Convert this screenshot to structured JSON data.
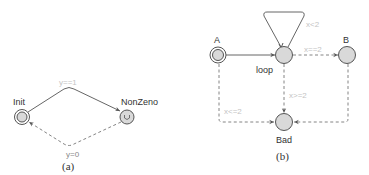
{
  "figures": [
    {
      "caption": "(a)",
      "locations": [
        {
          "id": "Init",
          "label": "Init",
          "initial": true,
          "urgent": false
        },
        {
          "id": "NonZeno",
          "label": "NonZeno",
          "initial": false,
          "urgent": true,
          "mark": "U"
        }
      ],
      "edges": [
        {
          "from": "Init",
          "to": "NonZeno",
          "style": "solid",
          "guard": "y==1"
        },
        {
          "from": "NonZeno",
          "to": "Init",
          "style": "dashed",
          "guard": "y=0"
        }
      ]
    },
    {
      "caption": "(b)",
      "locations": [
        {
          "id": "A",
          "label": "A",
          "initial": true
        },
        {
          "id": "loop",
          "label": "loop",
          "initial": false
        },
        {
          "id": "B",
          "label": "B",
          "initial": false
        },
        {
          "id": "Bad",
          "label": "Bad",
          "initial": false
        }
      ],
      "edges": [
        {
          "from": "A",
          "to": "loop",
          "style": "solid",
          "guard": ""
        },
        {
          "from": "loop",
          "to": "loop",
          "style": "solid",
          "guard": "x<2"
        },
        {
          "from": "loop",
          "to": "B",
          "style": "dashed",
          "guard": "x==2"
        },
        {
          "from": "loop",
          "to": "Bad",
          "style": "dashed",
          "guard": "x>=2"
        },
        {
          "from": "A",
          "to": "Bad",
          "style": "dashed",
          "guard": "x<=2"
        },
        {
          "from": "B",
          "to": "Bad",
          "style": "dashed",
          "guard": ""
        }
      ]
    }
  ],
  "colors": {
    "node_fill": "#d9d9d9",
    "stroke": "#555555",
    "guard_text": "#c4c4c4"
  }
}
